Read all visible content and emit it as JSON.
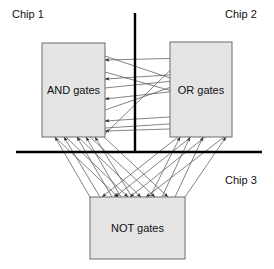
{
  "figure": {
    "type": "block-diagram",
    "width": 274,
    "height": 269,
    "background": "#ffffff"
  },
  "labels": {
    "chip1": "Chip 1",
    "chip2": "Chip 2",
    "chip3": "Chip 3"
  },
  "boxes": [
    {
      "id": "and",
      "label": "AND gates",
      "x": 42,
      "y": 43,
      "width": 63,
      "height": 94,
      "fill": "#e4e4e4",
      "stroke": "#6d6d6d"
    },
    {
      "id": "or",
      "label": "OR gates",
      "x": 170,
      "y": 42,
      "width": 62,
      "height": 95,
      "fill": "#e4e4e4",
      "stroke": "#6d6d6d"
    },
    {
      "id": "not",
      "label": "NOT gates",
      "x": 90,
      "y": 197,
      "width": 95,
      "height": 62,
      "fill": "#e4e4e4",
      "stroke": "#6d6d6d"
    }
  ],
  "dividers": [
    {
      "id": "vertical-divider",
      "orientation": "vertical",
      "x1": 135,
      "y1": 13,
      "x2": 135,
      "y2": 152,
      "width": 2.4,
      "color": "#000000"
    },
    {
      "id": "horizontal-divider",
      "orientation": "horizontal",
      "x1": 16,
      "y1": 152,
      "x2": 262,
      "y2": 152,
      "width": 2.4,
      "color": "#000000"
    }
  ],
  "label_positions": {
    "chip1": {
      "x": 12,
      "y": 18
    },
    "chip2": {
      "x": 225,
      "y": 18
    },
    "chip3": {
      "x": 225,
      "y": 184
    }
  },
  "wire_color": "#5a5a5a",
  "wires": [
    {
      "x1": 232,
      "y1": 57,
      "x2": 105,
      "y2": 60,
      "arrow": "end"
    },
    {
      "x1": 232,
      "y1": 71,
      "x2": 105,
      "y2": 79,
      "arrow": "end"
    },
    {
      "x1": 232,
      "y1": 85,
      "x2": 105,
      "y2": 99,
      "arrow": "end"
    },
    {
      "x1": 232,
      "y1": 113,
      "x2": 105,
      "y2": 121,
      "arrow": "end"
    },
    {
      "x1": 232,
      "y1": 127,
      "x2": 105,
      "y2": 131,
      "arrow": "end"
    },
    {
      "x1": 105,
      "y1": 56,
      "x2": 232,
      "y2": 99,
      "arrow": "end"
    },
    {
      "x1": 105,
      "y1": 72,
      "x2": 232,
      "y2": 108,
      "arrow": "end"
    },
    {
      "x1": 105,
      "y1": 88,
      "x2": 232,
      "y2": 75,
      "arrow": "end"
    },
    {
      "x1": 105,
      "y1": 110,
      "x2": 232,
      "y2": 66,
      "arrow": "end"
    },
    {
      "x1": 105,
      "y1": 128,
      "x2": 232,
      "y2": 120,
      "arrow": "end"
    },
    {
      "x1": 105,
      "y1": 134,
      "x2": 197,
      "y2": 44,
      "arrow": "end"
    },
    {
      "x1": 90,
      "y1": 197,
      "x2": 55,
      "y2": 137,
      "arrow": "end"
    },
    {
      "x1": 100,
      "y1": 197,
      "x2": 64,
      "y2": 137,
      "arrow": "end"
    },
    {
      "x1": 112,
      "y1": 197,
      "x2": 77,
      "y2": 137,
      "arrow": "end"
    },
    {
      "x1": 121,
      "y1": 197,
      "x2": 86,
      "y2": 137,
      "arrow": "end"
    },
    {
      "x1": 132,
      "y1": 197,
      "x2": 95,
      "y2": 137,
      "arrow": "end"
    },
    {
      "x1": 150,
      "y1": 197,
      "x2": 180,
      "y2": 137,
      "arrow": "end"
    },
    {
      "x1": 162,
      "y1": 197,
      "x2": 190,
      "y2": 137,
      "arrow": "end"
    },
    {
      "x1": 175,
      "y1": 197,
      "x2": 203,
      "y2": 137,
      "arrow": "end"
    },
    {
      "x1": 185,
      "y1": 197,
      "x2": 226,
      "y2": 137,
      "arrow": "end"
    },
    {
      "x1": 55,
      "y1": 137,
      "x2": 118,
      "y2": 197,
      "arrow": "end"
    },
    {
      "x1": 66,
      "y1": 137,
      "x2": 128,
      "y2": 197,
      "arrow": "end"
    },
    {
      "x1": 78,
      "y1": 137,
      "x2": 141,
      "y2": 197,
      "arrow": "end"
    },
    {
      "x1": 90,
      "y1": 137,
      "x2": 155,
      "y2": 197,
      "arrow": "end"
    },
    {
      "x1": 104,
      "y1": 137,
      "x2": 168,
      "y2": 197,
      "arrow": "end"
    },
    {
      "x1": 178,
      "y1": 137,
      "x2": 102,
      "y2": 197,
      "arrow": "end"
    },
    {
      "x1": 191,
      "y1": 137,
      "x2": 115,
      "y2": 197,
      "arrow": "end"
    },
    {
      "x1": 205,
      "y1": 137,
      "x2": 130,
      "y2": 197,
      "arrow": "end"
    },
    {
      "x1": 224,
      "y1": 137,
      "x2": 146,
      "y2": 197,
      "arrow": "end"
    }
  ]
}
